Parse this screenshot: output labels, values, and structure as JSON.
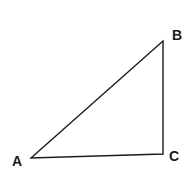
{
  "diagram": {
    "type": "right-triangle",
    "stroke_color": "#1a1a1a",
    "vertices": [
      {
        "label": "A",
        "x": 31,
        "y": 158
      },
      {
        "label": "B",
        "x": 163,
        "y": 41
      },
      {
        "label": "C",
        "x": 163,
        "y": 154
      }
    ],
    "labels": {
      "a": "A",
      "b": "B",
      "c": "C"
    },
    "right_angle_at": "C"
  }
}
